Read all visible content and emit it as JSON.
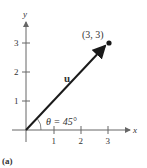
{
  "diagram": {
    "panel_label": "(a)",
    "axes": {
      "x_label": "x",
      "y_label": "y"
    },
    "x_ticks": [
      "1",
      "2",
      "3"
    ],
    "y_ticks": [
      "1",
      "2",
      "3"
    ],
    "vector": {
      "label": "u",
      "tip_point_label": "(3, 3)"
    },
    "angle_label": "θ = 45°",
    "colors": {
      "axis": "#666666",
      "vector": "#1a1a1a"
    }
  }
}
